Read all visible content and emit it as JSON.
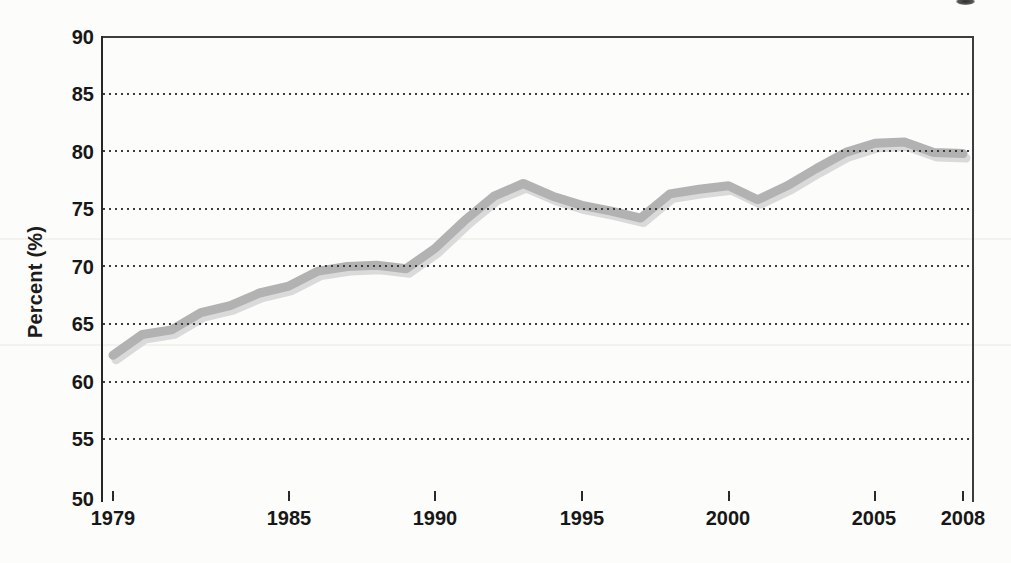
{
  "page": {
    "background_color": "#fcfcfa"
  },
  "chart_data": {
    "type": "line",
    "title": "",
    "xlabel": "",
    "ylabel": "Percent (%)",
    "x": [
      1979,
      1980,
      1981,
      1982,
      1983,
      1984,
      1985,
      1986,
      1987,
      1988,
      1989,
      1990,
      1991,
      1992,
      1993,
      1994,
      1995,
      1996,
      1997,
      1998,
      1999,
      2000,
      2001,
      2002,
      2003,
      2004,
      2005,
      2006,
      2007,
      2008
    ],
    "series": [
      {
        "name": "percent",
        "values": [
          62.3,
          64.1,
          64.5,
          66.0,
          66.6,
          67.7,
          68.3,
          69.6,
          70.0,
          70.1,
          69.8,
          71.6,
          74.0,
          76.1,
          77.2,
          76.1,
          75.3,
          74.8,
          74.2,
          76.3,
          76.7,
          77.0,
          75.8,
          77.0,
          78.5,
          79.9,
          80.7,
          80.8,
          79.9,
          79.8
        ]
      }
    ],
    "ylim": [
      50,
      90
    ],
    "xlim": [
      1979,
      2008
    ],
    "ytick_labels": [
      "90",
      "85",
      "80",
      "75",
      "70",
      "65",
      "60",
      "55",
      "50"
    ],
    "yticks": [
      90,
      85,
      80,
      75,
      70,
      65,
      60,
      55,
      50
    ],
    "xtick_labels": [
      "1979",
      "1985",
      "1990",
      "1995",
      "2000",
      "2005",
      "2008"
    ],
    "xticks": [
      1979,
      1985,
      1990,
      1995,
      2000,
      2005,
      2008
    ],
    "grid": "horizontal dotted lines at 55-85",
    "legend": "none",
    "line_color": "#b2b2b2",
    "line_shadow_color": "#dadada"
  }
}
